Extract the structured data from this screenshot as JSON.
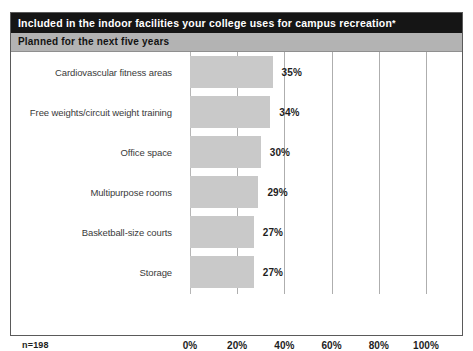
{
  "header": {
    "title": "Included in the indoor facilities your college uses for campus recreation",
    "title_footnote_marker": "*",
    "subtitle": "Planned for the next five years"
  },
  "footer": {
    "sample_size": "n=198"
  },
  "chart_data": {
    "type": "bar",
    "orientation": "horizontal",
    "title": "Included in the indoor facilities your college uses for campus recreation*",
    "subtitle": "Planned for the next five years",
    "categories": [
      "Cardiovascular fitness areas",
      "Free weights/circuit weight training",
      "Office space",
      "Multipurpose rooms",
      "Basketball-size courts",
      "Storage"
    ],
    "values": [
      35,
      34,
      30,
      29,
      27,
      27
    ],
    "value_labels": [
      "35%",
      "34%",
      "30%",
      "29%",
      "27%",
      "27%"
    ],
    "xlabel": "",
    "ylabel": "",
    "xlim": [
      0,
      100
    ],
    "xticks": [
      0,
      20,
      40,
      60,
      80,
      100
    ],
    "xtick_labels": [
      "0%",
      "20%",
      "40%",
      "60%",
      "80%",
      "100%"
    ],
    "grid": true,
    "grid_axis": "x",
    "legend": false,
    "bar_color": "#c9c9c9",
    "gridline_color": "#aeaeae",
    "title_bar_color": "#151515",
    "subtitle_bar_color": "#b3b3b3",
    "note": "n=198"
  }
}
